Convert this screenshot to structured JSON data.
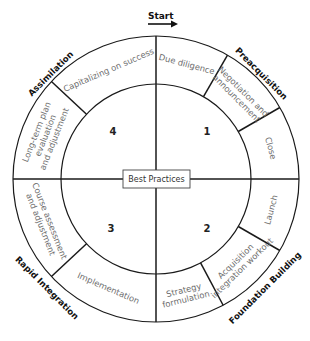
{
  "diagram": {
    "center_label": "Best Practices",
    "start_label": "Start",
    "geometry": {
      "cx": 156,
      "cy": 179,
      "outer_r": 143,
      "inner_r": 95
    },
    "quadrants": [
      {
        "number": "1",
        "phase": "Preacquisition"
      },
      {
        "number": "2",
        "phase": "Foundation Building"
      },
      {
        "number": "3",
        "phase": "Rapid Integration"
      },
      {
        "number": "4",
        "phase": "Assimilation"
      }
    ],
    "steps": [
      {
        "label": [
          "Due diligence"
        ],
        "quadrant": 1
      },
      {
        "label": [
          "Negotiation and",
          "announcement"
        ],
        "quadrant": 1
      },
      {
        "label": [
          "Close"
        ],
        "quadrant": 1
      },
      {
        "label": [
          "Launch"
        ],
        "quadrant": 2
      },
      {
        "label": [
          "Acquisition",
          "integration workout"
        ],
        "quadrant": 2
      },
      {
        "label": [
          "Strategy",
          "formulation"
        ],
        "quadrant": 2
      },
      {
        "label": [
          "Implementation"
        ],
        "quadrant": 3
      },
      {
        "label": [
          "Course assessment",
          "and adjustment"
        ],
        "quadrant": 3
      },
      {
        "label": [
          "Long-term plan",
          "evaluation",
          "and adjustment"
        ],
        "quadrant": 4
      },
      {
        "label": [
          "Capitalizing on success"
        ],
        "quadrant": 4
      }
    ],
    "dividers_deg": [
      0,
      30,
      60,
      90,
      120,
      152,
      180,
      227,
      270,
      313
    ],
    "colors": {
      "line": "#1a1a1a",
      "step_text": "#6e6e6e",
      "phase_text": "#111111"
    }
  }
}
